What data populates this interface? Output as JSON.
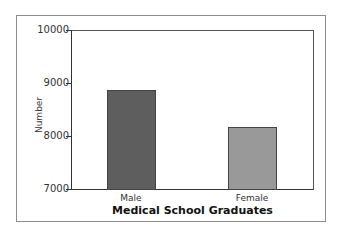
{
  "chart_data": {
    "type": "bar",
    "title": "",
    "xlabel": "Medical School Graduates",
    "ylabel": "Number",
    "categories": [
      "Male",
      "Female"
    ],
    "values": [
      8870,
      8190
    ],
    "colors": [
      "#5e5e5e",
      "#999999"
    ],
    "ylim": [
      7000,
      10000
    ],
    "yticks": [
      "10000",
      "9000",
      "8000",
      "7000"
    ],
    "grid": false,
    "legend": "none"
  }
}
